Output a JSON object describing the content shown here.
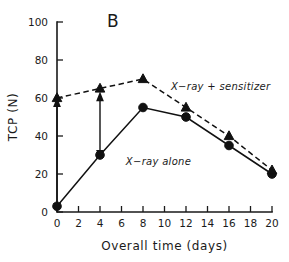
{
  "figure": {
    "panel_label": "B"
  },
  "chart_data": {
    "type": "line",
    "title": "B",
    "xlabel": "Overall time (days)",
    "ylabel": "TCP (N)",
    "xlim": [
      0,
      20
    ],
    "ylim": [
      0,
      100
    ],
    "xticks": [
      0,
      2,
      4,
      6,
      8,
      10,
      12,
      14,
      16,
      18,
      20
    ],
    "xtick_labels": [
      "0",
      "2",
      "4",
      "6",
      "8",
      "10",
      "12",
      "14",
      "16",
      "18",
      "20"
    ],
    "yticks": [
      0,
      20,
      40,
      60,
      80,
      100
    ],
    "ytick_labels": [
      "0",
      "20",
      "40",
      "60",
      "80",
      "100"
    ],
    "grid": false,
    "legend_position": "inline-annotations",
    "x": [
      0,
      4,
      8,
      12,
      16,
      20
    ],
    "series": [
      {
        "name": "X−ray alone",
        "values": [
          3,
          30,
          55,
          50,
          35,
          20
        ],
        "marker": "circle",
        "linestyle": "solid",
        "color": "#111111",
        "label_x": 6.4,
        "label_y": 25
      },
      {
        "name": "X−ray + sensitizer",
        "values": [
          60,
          65,
          70,
          55,
          40,
          22
        ],
        "marker": "triangle",
        "linestyle": "dashed",
        "color": "#111111",
        "label_x": 10.6,
        "label_y": 64
      }
    ],
    "annotations": [
      {
        "type": "double-arrow",
        "x": 0,
        "y_from": 3,
        "y_to": 57
      },
      {
        "type": "double-arrow",
        "x": 4,
        "y_from": 31,
        "y_to": 60
      }
    ]
  }
}
